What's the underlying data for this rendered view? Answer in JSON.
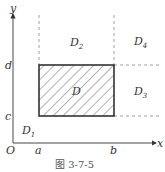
{
  "figure": {
    "caption": "图 3-7-5",
    "axes": {
      "x_label": "x",
      "y_label": "y",
      "origin_label": "O"
    },
    "ticks": {
      "x": [
        "a",
        "b"
      ],
      "y": [
        "c",
        "d"
      ]
    },
    "regions": [
      {
        "name": "D",
        "sub": ""
      },
      {
        "name": "D",
        "sub": "1"
      },
      {
        "name": "D",
        "sub": "2"
      },
      {
        "name": "D",
        "sub": "3"
      },
      {
        "name": "D",
        "sub": "4"
      }
    ],
    "colors": {
      "line": "#333333",
      "dashed": "#888888",
      "hatch": "#444444"
    }
  }
}
